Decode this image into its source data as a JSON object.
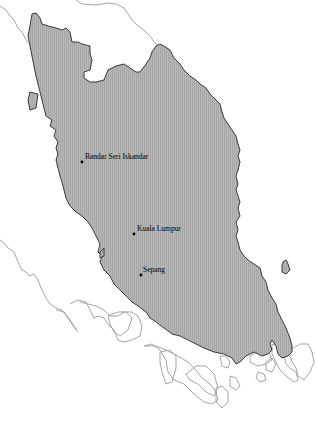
{
  "map": {
    "title": "",
    "region": "Peninsular Malaysia",
    "colors": {
      "land_fill": "#b4b4b4",
      "land_hatch": "#a6a6a6",
      "coastline": "#3a3a3a",
      "neighbor_outline": "#9a9a9a",
      "background": "#ffffff"
    },
    "cities": [
      {
        "name": "Bandar Seri Iskandar",
        "x": 82,
        "y": 162
      },
      {
        "name": "Kuala Lumpur",
        "x": 134,
        "y": 234
      },
      {
        "name": "Sepang",
        "x": 141,
        "y": 275
      }
    ]
  }
}
